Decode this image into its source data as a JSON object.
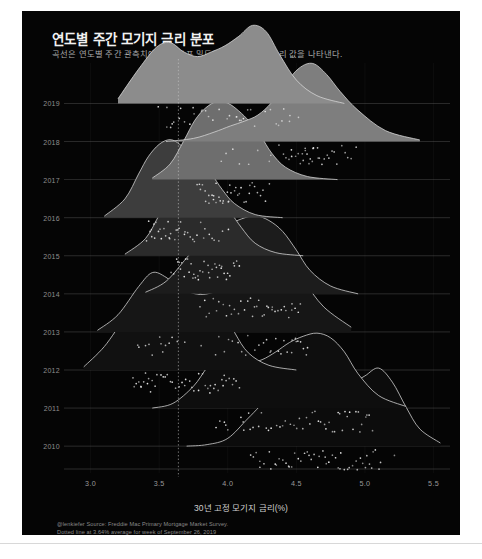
{
  "header": {
    "title": "연도별 주간 모기지 금리 분포",
    "subtitle": "곡선은 연도별 주간 관측치에 맞춘 분포 밀도이며, 점은 주간 금리 값을 나타낸다."
  },
  "caption": {
    "line1": "@lenkiefer Source: Freddie Mac Primary Mortgage Market Survey.",
    "line2": "Dotted line at 3.64% average for week of September 26, 2019"
  },
  "colors": {
    "background": "#050505",
    "page": "#ffffff",
    "curve_stroke": "#d9d9d9",
    "axis_text": "#9a9a9a",
    "gridline": "#6a6a6a",
    "reference_line": "#c9c9c9",
    "point": "#e8e8e8"
  },
  "chart_data": {
    "type": "area",
    "title": "연도별 주간 모기지 금리 분포",
    "subtitle": "곡선은 연도별 주간 관측치에 맞춘 분포 밀도이며, 점은 주간 금리 값을 나타낸다.",
    "xlabel": "30년 고정 모기지 금리(%)",
    "ylabel": "",
    "xlim": [
      2.85,
      5.62
    ],
    "ylim": [
      2009.4,
      2019.8
    ],
    "grid": true,
    "legend": "none",
    "xticks": [
      3.0,
      3.5,
      4.0,
      4.5,
      5.0,
      5.5
    ],
    "xtick_labels": [
      "3.0",
      "3.5",
      "4.0",
      "4.5",
      "5.0",
      "5.5"
    ],
    "yticks": [
      2010,
      2011,
      2012,
      2013,
      2014,
      2015,
      2016,
      2017,
      2018,
      2019
    ],
    "ytick_labels": [
      "2010",
      "2011",
      "2012",
      "2013",
      "2014",
      "2015",
      "2016",
      "2017",
      "2018",
      "2019"
    ],
    "annotations": [
      {
        "type": "vline",
        "x": 3.64,
        "style": "dotted",
        "label": "3.64% average for week of September 26, 2019"
      }
    ],
    "series": [
      {
        "name": "2010",
        "year": 2010,
        "fill": "#0c0c0c",
        "mean": 4.69,
        "min": 4.17,
        "max": 5.21,
        "density_x": [
          3.7,
          3.85,
          4.0,
          4.15,
          4.3,
          4.4,
          4.5,
          4.6,
          4.7,
          4.8,
          4.9,
          5.0,
          5.1,
          5.2,
          5.3,
          5.4,
          5.55
        ],
        "density_y": [
          0.0,
          0.02,
          0.1,
          0.36,
          0.62,
          0.7,
          0.72,
          0.7,
          0.68,
          0.72,
          0.8,
          0.9,
          1.0,
          0.82,
          0.5,
          0.22,
          0.04
        ],
        "points": [
          4.17,
          4.19,
          4.21,
          4.23,
          4.24,
          4.27,
          4.3,
          4.32,
          4.35,
          4.36,
          4.38,
          4.4,
          4.42,
          4.44,
          4.45,
          4.47,
          4.49,
          4.51,
          4.54,
          4.56,
          4.58,
          4.59,
          4.61,
          4.63,
          4.65,
          4.67,
          4.69,
          4.71,
          4.72,
          4.74,
          4.76,
          4.78,
          4.8,
          4.82,
          4.83,
          4.85,
          4.87,
          4.89,
          4.91,
          4.93,
          4.95,
          4.97,
          4.99,
          5.0,
          5.02,
          5.04,
          5.05,
          5.06,
          5.08,
          5.1,
          5.12,
          5.21
        ]
      },
      {
        "name": "2011",
        "year": 2011,
        "fill": "#0e0e0e",
        "mean": 4.45,
        "min": 3.91,
        "max": 5.05,
        "density_x": [
          3.45,
          3.6,
          3.75,
          3.85,
          3.95,
          4.05,
          4.15,
          4.25,
          4.35,
          4.45,
          4.55,
          4.65,
          4.75,
          4.85,
          4.95,
          5.1,
          5.3
        ],
        "density_y": [
          0.0,
          0.06,
          0.28,
          0.52,
          0.7,
          0.66,
          0.58,
          0.62,
          0.72,
          0.84,
          0.92,
          0.96,
          0.9,
          0.72,
          0.44,
          0.16,
          0.02
        ],
        "points": [
          3.91,
          3.94,
          3.97,
          3.99,
          4.0,
          4.09,
          4.11,
          4.12,
          4.15,
          4.17,
          4.19,
          4.22,
          4.25,
          4.28,
          4.3,
          4.32,
          4.35,
          4.38,
          4.4,
          4.42,
          4.45,
          4.48,
          4.5,
          4.52,
          4.55,
          4.58,
          4.6,
          4.61,
          4.63,
          4.66,
          4.68,
          4.7,
          4.71,
          4.74,
          4.76,
          4.78,
          4.8,
          4.81,
          4.84,
          4.86,
          4.87,
          4.89,
          4.91,
          4.93,
          4.95,
          4.96,
          4.98,
          5.0,
          5.01,
          5.03,
          5.05
        ]
      },
      {
        "name": "2012",
        "year": 2012,
        "fill": "#111111",
        "mean": 3.66,
        "min": 3.31,
        "max": 4.08,
        "density_x": [
          2.95,
          3.1,
          3.25,
          3.35,
          3.45,
          3.55,
          3.65,
          3.75,
          3.85,
          3.95,
          4.05,
          4.15,
          4.3,
          4.5
        ],
        "density_y": [
          0.04,
          0.3,
          0.66,
          0.78,
          0.74,
          0.72,
          0.78,
          0.92,
          1.0,
          0.82,
          0.48,
          0.22,
          0.06,
          0.0
        ],
        "points": [
          3.31,
          3.32,
          3.34,
          3.35,
          3.36,
          3.37,
          3.39,
          3.4,
          3.41,
          3.43,
          3.44,
          3.45,
          3.47,
          3.49,
          3.51,
          3.53,
          3.55,
          3.56,
          3.58,
          3.6,
          3.62,
          3.64,
          3.66,
          3.68,
          3.7,
          3.72,
          3.74,
          3.75,
          3.78,
          3.79,
          3.81,
          3.83,
          3.85,
          3.87,
          3.88,
          3.9,
          3.91,
          3.93,
          3.95,
          3.96,
          3.98,
          3.99,
          4.01,
          4.03,
          4.05,
          4.06,
          4.08
        ]
      },
      {
        "name": "2013",
        "year": 2013,
        "fill": "#161616",
        "mean": 3.98,
        "min": 3.34,
        "max": 4.58,
        "density_x": [
          3.05,
          3.2,
          3.35,
          3.45,
          3.55,
          3.65,
          3.8,
          3.95,
          4.1,
          4.25,
          4.35,
          4.45,
          4.55,
          4.7,
          4.9
        ],
        "density_y": [
          0.02,
          0.22,
          0.58,
          0.76,
          0.7,
          0.56,
          0.48,
          0.54,
          0.68,
          0.84,
          0.92,
          0.88,
          0.66,
          0.32,
          0.06
        ],
        "points": [
          3.34,
          3.35,
          3.4,
          3.42,
          3.45,
          3.5,
          3.51,
          3.53,
          3.54,
          3.57,
          3.59,
          3.63,
          3.68,
          3.81,
          3.91,
          3.93,
          3.98,
          4.0,
          4.04,
          4.07,
          4.1,
          4.13,
          4.15,
          4.2,
          4.23,
          4.26,
          4.28,
          4.31,
          4.32,
          4.35,
          4.37,
          4.39,
          4.41,
          4.43,
          4.46,
          4.47,
          4.49,
          4.5,
          4.51,
          4.53,
          4.55,
          4.57,
          4.58
        ]
      },
      {
        "name": "2014",
        "year": 2014,
        "fill": "#1c1c1c",
        "mean": 4.17,
        "min": 3.8,
        "max": 4.53,
        "density_x": [
          3.4,
          3.55,
          3.7,
          3.8,
          3.9,
          4.0,
          4.1,
          4.2,
          4.3,
          4.4,
          4.5,
          4.6,
          4.75,
          4.95
        ],
        "density_y": [
          0.02,
          0.16,
          0.46,
          0.66,
          0.78,
          0.88,
          0.96,
          1.0,
          0.94,
          0.8,
          0.56,
          0.3,
          0.1,
          0.0
        ],
        "points": [
          3.8,
          3.83,
          3.85,
          3.87,
          3.89,
          3.92,
          3.94,
          3.97,
          3.99,
          4.01,
          4.03,
          4.05,
          4.08,
          4.1,
          4.12,
          4.14,
          4.16,
          4.18,
          4.2,
          4.21,
          4.23,
          4.25,
          4.27,
          4.28,
          4.3,
          4.32,
          4.33,
          4.35,
          4.37,
          4.39,
          4.41,
          4.42,
          4.44,
          4.46,
          4.47,
          4.49,
          4.51,
          4.53
        ]
      },
      {
        "name": "2015",
        "year": 2015,
        "fill": "#2b2b2b",
        "mean": 3.85,
        "min": 3.59,
        "max": 4.09,
        "density_x": [
          3.25,
          3.4,
          3.5,
          3.58,
          3.65,
          3.72,
          3.8,
          3.88,
          3.95,
          4.02,
          4.1,
          4.2,
          4.35,
          4.55
        ],
        "density_y": [
          0.02,
          0.22,
          0.52,
          0.74,
          0.92,
          1.0,
          0.96,
          0.84,
          0.72,
          0.56,
          0.36,
          0.16,
          0.04,
          0.0
        ],
        "points": [
          3.59,
          3.61,
          3.63,
          3.64,
          3.65,
          3.66,
          3.67,
          3.68,
          3.69,
          3.7,
          3.72,
          3.73,
          3.74,
          3.75,
          3.76,
          3.78,
          3.79,
          3.8,
          3.82,
          3.83,
          3.85,
          3.86,
          3.87,
          3.88,
          3.9,
          3.91,
          3.93,
          3.94,
          3.95,
          3.96,
          3.98,
          3.99,
          4.0,
          4.02,
          4.04,
          4.05,
          4.07,
          4.09
        ]
      },
      {
        "name": "2016",
        "year": 2016,
        "fill": "#3d3d3d",
        "mean": 3.65,
        "min": 3.41,
        "max": 4.0,
        "density_x": [
          3.1,
          3.25,
          3.35,
          3.42,
          3.5,
          3.58,
          3.65,
          3.72,
          3.8,
          3.88,
          3.96,
          4.05,
          4.2,
          4.4
        ],
        "density_y": [
          0.02,
          0.24,
          0.56,
          0.78,
          0.94,
          1.0,
          0.94,
          0.82,
          0.7,
          0.56,
          0.36,
          0.18,
          0.04,
          0.0
        ],
        "points": [
          3.41,
          3.42,
          3.43,
          3.44,
          3.45,
          3.46,
          3.47,
          3.48,
          3.49,
          3.5,
          3.52,
          3.53,
          3.54,
          3.56,
          3.57,
          3.58,
          3.59,
          3.61,
          3.62,
          3.64,
          3.65,
          3.66,
          3.68,
          3.69,
          3.71,
          3.72,
          3.74,
          3.76,
          3.78,
          3.8,
          3.82,
          3.84,
          3.86,
          3.88,
          3.9,
          3.93,
          3.96,
          4.0
        ]
      },
      {
        "name": "2017",
        "year": 2017,
        "fill": "#6e6e6e",
        "mean": 3.99,
        "min": 3.78,
        "max": 4.3,
        "density_x": [
          3.45,
          3.58,
          3.68,
          3.76,
          3.84,
          3.92,
          4.0,
          4.08,
          4.16,
          4.24,
          4.32,
          4.42,
          4.58,
          4.8
        ],
        "density_y": [
          0.02,
          0.2,
          0.5,
          0.76,
          0.92,
          1.0,
          0.98,
          0.88,
          0.74,
          0.56,
          0.34,
          0.16,
          0.04,
          0.0
        ],
        "points": [
          3.78,
          3.79,
          3.8,
          3.82,
          3.83,
          3.84,
          3.86,
          3.87,
          3.88,
          3.89,
          3.9,
          3.91,
          3.92,
          3.94,
          3.95,
          3.96,
          3.97,
          3.99,
          4.0,
          4.01,
          4.02,
          4.03,
          4.05,
          4.06,
          4.08,
          4.09,
          4.1,
          4.12,
          4.13,
          4.15,
          4.16,
          4.18,
          4.2,
          4.22,
          4.24,
          4.26,
          4.28,
          4.3
        ]
      },
      {
        "name": "2018",
        "year": 2018,
        "fill": "#7e7e7e",
        "mean": 4.54,
        "min": 3.95,
        "max": 4.94,
        "density_x": [
          3.55,
          3.75,
          3.9,
          4.02,
          4.12,
          4.22,
          4.32,
          4.42,
          4.52,
          4.62,
          4.72,
          4.82,
          4.95,
          5.15,
          5.4
        ],
        "density_y": [
          0.0,
          0.04,
          0.12,
          0.2,
          0.26,
          0.34,
          0.5,
          0.74,
          0.94,
          1.0,
          0.86,
          0.64,
          0.4,
          0.14,
          0.02
        ],
        "points": [
          3.95,
          3.99,
          4.03,
          4.08,
          4.15,
          4.22,
          4.3,
          4.32,
          4.38,
          4.4,
          4.43,
          4.44,
          4.46,
          4.47,
          4.5,
          4.51,
          4.53,
          4.54,
          4.55,
          4.56,
          4.57,
          4.58,
          4.59,
          4.6,
          4.61,
          4.62,
          4.63,
          4.65,
          4.66,
          4.67,
          4.69,
          4.71,
          4.72,
          4.74,
          4.76,
          4.78,
          4.8,
          4.83,
          4.85,
          4.87,
          4.9,
          4.94
        ]
      },
      {
        "name": "2019",
        "year": 2019,
        "fill": "#8c8c8c",
        "mean": 3.94,
        "min": 3.49,
        "max": 4.51,
        "density_x": [
          3.2,
          3.35,
          3.48,
          3.58,
          3.68,
          3.78,
          3.88,
          3.98,
          4.08,
          4.18,
          4.28,
          4.38,
          4.5,
          4.65,
          4.85
        ],
        "density_y": [
          0.06,
          0.44,
          0.72,
          0.78,
          0.66,
          0.6,
          0.66,
          0.74,
          0.86,
          1.0,
          0.92,
          0.62,
          0.3,
          0.1,
          0.0
        ],
        "points": [
          3.49,
          3.55,
          3.56,
          3.58,
          3.6,
          3.6,
          3.64,
          3.65,
          3.69,
          3.73,
          3.75,
          3.75,
          3.81,
          3.82,
          3.84,
          3.86,
          3.89,
          3.94,
          3.99,
          4.01,
          4.06,
          4.07,
          4.08,
          4.1,
          4.12,
          4.14,
          4.17,
          4.2,
          4.28,
          4.31,
          4.35,
          4.37,
          4.4,
          4.41,
          4.45,
          4.46,
          4.51
        ]
      }
    ]
  }
}
